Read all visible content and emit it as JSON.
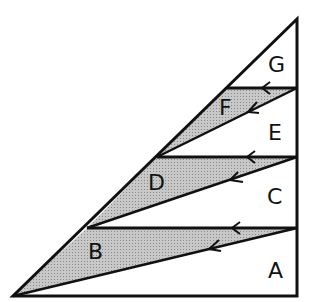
{
  "diagram": {
    "type": "triangle-zigzag-partition",
    "shading_color": "#b8b8b8",
    "line_color": "#111111",
    "regions": [
      {
        "label": "A",
        "shaded": false
      },
      {
        "label": "B",
        "shaded": true
      },
      {
        "label": "C",
        "shaded": false
      },
      {
        "label": "D",
        "shaded": true
      },
      {
        "label": "E",
        "shaded": false
      },
      {
        "label": "F",
        "shaded": true
      },
      {
        "label": "G",
        "shaded": false
      }
    ],
    "arrows": "leftward arrows along each horizontal and slanted line"
  }
}
